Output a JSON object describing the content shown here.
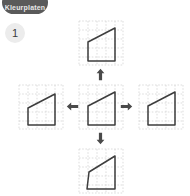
{
  "logo": {
    "text": "Kleurplaten",
    "icon": "brand-badge-icon",
    "color": "#5a5a5a"
  },
  "exercise": {
    "number": "1",
    "badge_color": "#ececec"
  },
  "colors": {
    "stroke": "#3d3d3d",
    "grid": "#cfcfcf",
    "background": "#ffffff",
    "arrow": "#4a4a4a"
  },
  "figure": {
    "type": "transformation-grid",
    "grid": {
      "cols": 5,
      "rows": 5,
      "cell_px": 9.2,
      "dashed": true
    },
    "panels": [
      {
        "id": "top",
        "position": "top",
        "name": "shape-top",
        "polygon": "10,22 10,41 37,41 37,8",
        "description": "quadrilateral with vertical left edge, rising top edge"
      },
      {
        "id": "left",
        "position": "left",
        "name": "shape-left",
        "polygon": "10,24 10,41 37,41 37,10",
        "description": "quadrilateral with vertical left edge, rising top edge"
      },
      {
        "id": "center",
        "position": "center",
        "name": "shape-center",
        "polygon": "10,22 10,41 37,41 37,8",
        "description": "original quadrilateral, vertical left edge, rising top edge"
      },
      {
        "id": "right",
        "position": "right",
        "name": "shape-right",
        "polygon": "10,22 10,41 37,41 37,8",
        "description": "quadrilateral with vertical left edge, rising top edge"
      },
      {
        "id": "bottom",
        "position": "bottom",
        "name": "shape-bottom",
        "polygon": "11,24 9,41 37,41 37,8",
        "description": "quadrilateral with slanted left edge, rising top edge"
      }
    ],
    "arrows": [
      {
        "id": "up",
        "direction": "up",
        "name": "arrow-up-icon"
      },
      {
        "id": "left",
        "direction": "left",
        "name": "arrow-left-icon"
      },
      {
        "id": "right",
        "direction": "right",
        "name": "arrow-right-icon"
      },
      {
        "id": "down",
        "direction": "down",
        "name": "arrow-down-icon"
      }
    ]
  }
}
